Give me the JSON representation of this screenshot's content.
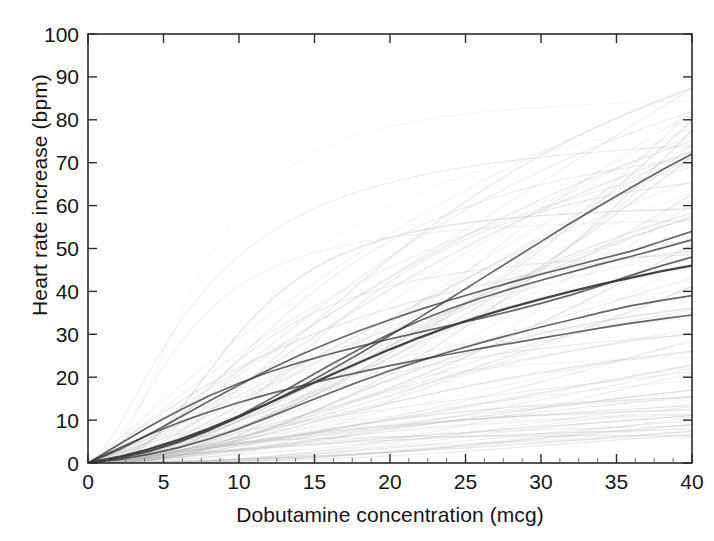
{
  "chart_data": {
    "type": "line",
    "title": "",
    "subtitle": "",
    "xlabel": "Dobutamine concentration (mcg)",
    "ylabel": "Heart rate increase (bpm)",
    "xlim": [
      0,
      40
    ],
    "ylim": [
      0,
      100
    ],
    "xticks": [
      0,
      5,
      10,
      15,
      20,
      25,
      30,
      35,
      40
    ],
    "yticks": [
      0,
      10,
      20,
      30,
      40,
      50,
      60,
      70,
      80,
      90,
      100
    ],
    "x_minor_tick_step": 1.25,
    "grid": false,
    "legend": null,
    "legend_position": "none",
    "annotations": [],
    "colors": {
      "axis": "#2b2b2b",
      "text": "#151515",
      "background": "#ffffff",
      "highlight_curve": "#3a3a3a",
      "population_curve": "#b9b9b9"
    },
    "x": [
      0,
      2,
      4,
      6,
      8,
      10,
      12,
      14,
      16,
      18,
      20,
      22,
      24,
      26,
      28,
      30,
      32,
      34,
      36,
      38,
      40
    ],
    "series": [
      {
        "name": "highlight-1",
        "emphasis": "dark",
        "endpoint": [
          40,
          72
        ],
        "values": [
          0,
          1.2,
          2.8,
          5.0,
          7.6,
          10.6,
          14.0,
          17.6,
          21.5,
          25.5,
          29.7,
          34.0,
          38.4,
          42.8,
          47.2,
          51.6,
          56.0,
          60.2,
          64.3,
          68.3,
          72.0
        ]
      },
      {
        "name": "highlight-2",
        "emphasis": "dark",
        "endpoint": [
          40,
          54
        ],
        "values": [
          0,
          3.0,
          6.6,
          10.5,
          14.4,
          18.2,
          21.8,
          25.1,
          28.1,
          30.9,
          33.4,
          35.8,
          38.0,
          40.1,
          42.1,
          44.0,
          45.8,
          47.6,
          49.4,
          51.7,
          54.0
        ]
      },
      {
        "name": "highlight-3",
        "emphasis": "dark",
        "endpoint": [
          40,
          52
        ],
        "values": [
          0,
          1.0,
          2.6,
          4.8,
          7.6,
          11.0,
          14.8,
          18.8,
          22.8,
          26.6,
          30.1,
          33.2,
          36.0,
          38.4,
          40.6,
          42.6,
          44.5,
          46.4,
          48.2,
          50.1,
          52.0
        ]
      },
      {
        "name": "highlight-4-mean",
        "emphasis": "darkest",
        "endpoint": [
          40,
          46
        ],
        "values": [
          0,
          1.4,
          3.2,
          5.4,
          8.0,
          10.9,
          14.0,
          17.2,
          20.4,
          23.5,
          26.5,
          29.3,
          31.9,
          34.2,
          36.3,
          38.2,
          40.0,
          41.7,
          43.2,
          44.7,
          46.0
        ]
      },
      {
        "name": "highlight-5",
        "emphasis": "dark",
        "endpoint": [
          40,
          48
        ],
        "values": [
          0,
          4.2,
          8.4,
          12.2,
          15.6,
          18.6,
          21.2,
          23.4,
          25.4,
          27.2,
          28.9,
          30.5,
          32.1,
          33.7,
          35.4,
          37.2,
          39.2,
          41.4,
          43.8,
          46.0,
          48.0
        ]
      },
      {
        "name": "highlight-6",
        "emphasis": "dark",
        "endpoint": [
          40,
          39
        ],
        "values": [
          0,
          0.8,
          2.0,
          3.6,
          5.6,
          8.0,
          10.7,
          13.5,
          16.3,
          19.0,
          21.5,
          23.8,
          26.0,
          28.0,
          29.9,
          31.7,
          33.4,
          35.1,
          36.7,
          37.9,
          39.0
        ]
      },
      {
        "name": "highlight-7",
        "emphasis": "dark",
        "endpoint": [
          40,
          34.5
        ],
        "values": [
          0,
          3.4,
          6.6,
          9.4,
          11.9,
          14.1,
          16.1,
          17.9,
          19.6,
          21.2,
          22.7,
          24.1,
          25.4,
          26.7,
          27.9,
          29.1,
          30.3,
          31.5,
          32.6,
          33.6,
          34.5
        ]
      }
    ],
    "population_envelope": {
      "n_curves": 92,
      "max_at_x40": 88,
      "min_at_x40": 6,
      "median_at_x40": 40
    }
  }
}
